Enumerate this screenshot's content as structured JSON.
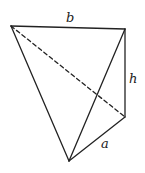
{
  "diagram": {
    "type": "tetrahedron",
    "vertices": {
      "top_left": [
        11,
        26
      ],
      "top_right": [
        125,
        29
      ],
      "right_lower": [
        125,
        117
      ],
      "bottom": [
        69,
        161
      ]
    },
    "edges": {
      "solid": [
        [
          "top_left",
          "top_right"
        ],
        [
          "top_right",
          "right_lower"
        ],
        [
          "right_lower",
          "bottom"
        ],
        [
          "top_left",
          "bottom"
        ],
        [
          "top_right",
          "bottom"
        ]
      ],
      "dashed": [
        [
          "top_left",
          "right_lower"
        ]
      ]
    },
    "labels": {
      "b": {
        "text": "b",
        "x": 66,
        "y": 22
      },
      "h": {
        "text": "h",
        "x": 129,
        "y": 83
      },
      "a": {
        "text": "a",
        "x": 101,
        "y": 148
      }
    },
    "colors": {
      "stroke": "#222222",
      "background": "#ffffff"
    }
  }
}
